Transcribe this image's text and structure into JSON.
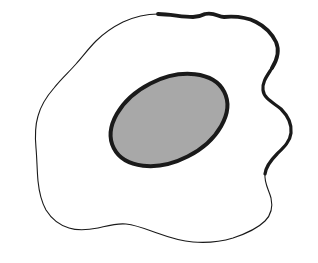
{
  "figure": {
    "kind": "line-drawing",
    "caption": "",
    "canvas": {
      "width": 318,
      "height": 263,
      "background_color": "#ffffff"
    },
    "ink_color": "#1a1a1a",
    "shapes": {
      "egg_white": {
        "name": "egg-white-blob",
        "fill_color": "#ffffff",
        "stroke_color": "#1a1a1a",
        "stroke_width_min": 1.1,
        "stroke_width_max": 3.8,
        "bounds": {
          "x_min": 35,
          "x_max": 292,
          "y_min": 13,
          "y_max": 242
        },
        "path": "M 205 14 C 215 12 218 17 224 17 C 236 16 246 17 256 22 C 266 27 272 34 276 42 C 280 51 277 60 272 68 C 267 76 262 82 263 90 C 264 99 274 103 281 109 C 288 116 292 124 291 133 C 290 142 283 148 277 154 C 271 160 266 166 265 174 C 264 183 269 190 271 198 C 273 207 271 215 265 221 C 257 229 245 234 233 238 C 220 242 206 243 193 242 C 180 241 168 237 157 233 C 146 229 136 225 126 224 C 116 223 107 226 98 228 C 88 230 78 231 69 228 C 59 225 51 218 46 210 C 41 201 39 191 38 181 C 37 170 37 159 36 148 C 35 137 35 126 38 116 C 41 105 47 96 54 88 C 61 79 69 72 76 64 C 83 56 89 48 96 41 C 104 33 113 27 123 22 C 134 17 146 14 158 14 C 170 14 182 17 193 17 C 198 17 201 16 205 14 Z"
      },
      "yolk": {
        "name": "egg-yolk-ellipse",
        "fill_color": "#a8a8a8",
        "stroke_color": "#1a1a1a",
        "stroke_width": 4.0,
        "center_x": 169,
        "center_y": 120,
        "radius_x": 62,
        "radius_y": 41,
        "rotation_deg": -27,
        "bounds": {
          "x_min": 110,
          "x_max": 228,
          "y_min": 71,
          "y_max": 168
        }
      }
    }
  }
}
